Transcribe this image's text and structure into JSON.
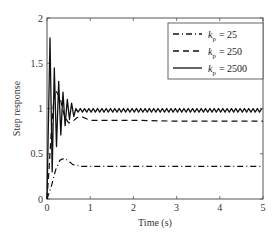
{
  "chart_data": {
    "type": "line",
    "title": "",
    "xlabel": "Time (s)",
    "ylabel": "Step response",
    "xlim": [
      0,
      5
    ],
    "ylim": [
      0,
      2
    ],
    "xticks": [
      "0",
      "1",
      "2",
      "3",
      "4",
      "5"
    ],
    "yticks": [
      "0",
      "0.5",
      "1",
      "1.5",
      "2"
    ],
    "grid": false,
    "legend_position": "upper right",
    "series": [
      {
        "name": "k_p = 25",
        "label_base": "k",
        "label_sub": "p",
        "label_value": "= 25",
        "style": "dash-dot",
        "x": [
          0,
          0.1,
          0.2,
          0.3,
          0.4,
          0.5,
          0.6,
          0.8,
          1.0,
          1.5,
          2,
          3,
          4,
          5
        ],
        "y": [
          0,
          0.14,
          0.32,
          0.43,
          0.45,
          0.42,
          0.38,
          0.36,
          0.36,
          0.36,
          0.36,
          0.36,
          0.36,
          0.36
        ]
      },
      {
        "name": "k_p = 250",
        "label_base": "k",
        "label_sub": "p",
        "label_value": "= 250",
        "style": "dashed",
        "x": [
          0,
          0.05,
          0.1,
          0.15,
          0.2,
          0.3,
          0.4,
          0.5,
          0.6,
          0.7,
          0.8,
          0.9,
          1.0,
          1.2,
          1.5,
          2,
          3,
          4,
          5
        ],
        "y": [
          0,
          0.35,
          0.75,
          1.05,
          1.2,
          1.12,
          0.92,
          0.84,
          0.86,
          0.9,
          0.91,
          0.89,
          0.87,
          0.87,
          0.87,
          0.87,
          0.86,
          0.86,
          0.86
        ]
      },
      {
        "name": "k_p = 2500",
        "label_base": "k",
        "label_sub": "p",
        "label_value": "= 2500",
        "style": "solid",
        "peaks": [
          {
            "t": 0.07,
            "y": 1.78
          },
          {
            "t": 0.17,
            "y": 1.45
          },
          {
            "t": 0.27,
            "y": 1.3
          },
          {
            "t": 0.37,
            "y": 1.18
          },
          {
            "t": 0.47,
            "y": 1.1
          },
          {
            "t": 0.57,
            "y": 1.06
          }
        ],
        "steady_state": 0.98,
        "steady_ripple": 0.02,
        "ripple_period_s": 0.1
      }
    ]
  }
}
